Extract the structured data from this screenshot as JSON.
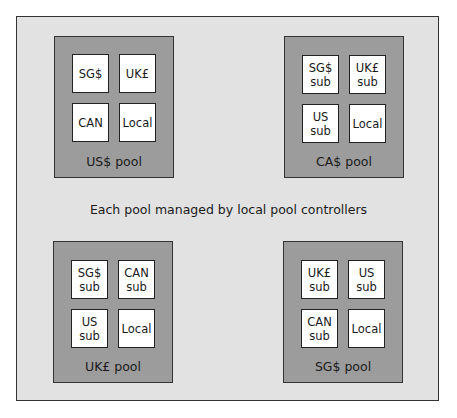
{
  "diagram": {
    "caption": "Each pool managed by local pool controllers",
    "pools": [
      {
        "label": "US$ pool",
        "subs": [
          "SG$",
          "UK£",
          "CAN",
          "Local"
        ]
      },
      {
        "label": "CA$ pool",
        "subs": [
          "SG$\nsub",
          "UK£\nsub",
          "US\nsub",
          "Local"
        ]
      },
      {
        "label": "UK£ pool",
        "subs": [
          "SG$\nsub",
          "CAN\nsub",
          "US\nsub",
          "Local"
        ]
      },
      {
        "label": "SG$ pool",
        "subs": [
          "UK£\nsub",
          "US\nsub",
          "CAN\nsub",
          "Local"
        ]
      }
    ]
  }
}
